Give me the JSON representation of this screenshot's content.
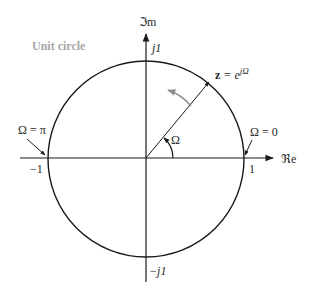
{
  "diagram": {
    "title": "Unit circle",
    "axes": {
      "imag_label": "ℑm",
      "real_label": "ℜe",
      "tick_j1": "j1",
      "tick_neg_j1": "−j1",
      "tick_1": "1",
      "tick_neg_1": "−1"
    },
    "vector": {
      "label_z": "z",
      "label_eq": " = e",
      "label_exp": "jΩ"
    },
    "angle_label": "Ω",
    "annotations": {
      "omega_zero": "Ω = 0",
      "omega_pi": "Ω = π"
    },
    "colors": {
      "line": "#1a1a1a",
      "gray_text": "#a8a8a8",
      "gray_arrow": "#8c8c8c"
    }
  }
}
